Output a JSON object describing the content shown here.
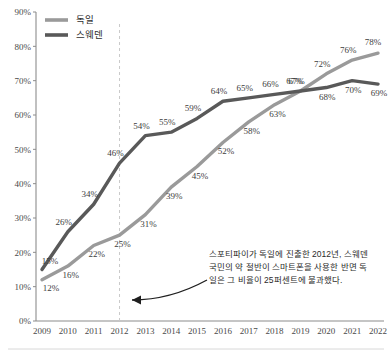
{
  "chart_data": {
    "type": "line",
    "title": "",
    "xlabel": "",
    "ylabel": "",
    "categories": [
      "2009",
      "2010",
      "2011",
      "2012",
      "2013",
      "2014",
      "2015",
      "2016",
      "2017",
      "2018",
      "2019",
      "2020",
      "2021",
      "2022"
    ],
    "ylim": [
      0,
      90
    ],
    "yticks": [
      "0%",
      "10%",
      "20%",
      "30%",
      "40%",
      "50%",
      "60%",
      "70%",
      "80%",
      "90%"
    ],
    "ytick_values": [
      0,
      10,
      20,
      30,
      40,
      50,
      60,
      70,
      80,
      90
    ],
    "grid": false,
    "legend_position": "top-left",
    "value_suffix": "%",
    "series": [
      {
        "name": "독일",
        "color": "#9a9a9a",
        "values": [
          12,
          16,
          22,
          25,
          31,
          39,
          45,
          52,
          58,
          63,
          67,
          72,
          76,
          78
        ],
        "labels": [
          "12%",
          "16%",
          "22%",
          "25%",
          "31%",
          "39%",
          "45%",
          "52%",
          "58%",
          "63%",
          "67%",
          "72%",
          "76%",
          "78%"
        ]
      },
      {
        "name": "스웨덴",
        "color": "#595959",
        "values": [
          15,
          26,
          34,
          46,
          54,
          55,
          59,
          64,
          65,
          66,
          67,
          68,
          70,
          69
        ],
        "labels": [
          "15%",
          "26%",
          "34%",
          "46%",
          "54%",
          "55%",
          "59%",
          "64%",
          "65%",
          "66%",
          "67%",
          "68%",
          "70%",
          "69%"
        ]
      }
    ],
    "marker_line": {
      "category": "2012",
      "style": "dashed",
      "color": "#c9c9c9"
    },
    "annotation": {
      "lines": [
        "스포티파이가 독일에 진출한 2012년, 스웨덴",
        "국민의 약 절반이 스마트폰을 사용한 반면 독",
        "일은 그 비율이 25퍼센트에 불과했다."
      ],
      "arrow": "curved-arrow-pointing-left"
    }
  },
  "legend": {
    "items": [
      {
        "label": "독일",
        "color": "#9a9a9a"
      },
      {
        "label": "스웨덴",
        "color": "#595959"
      }
    ]
  }
}
